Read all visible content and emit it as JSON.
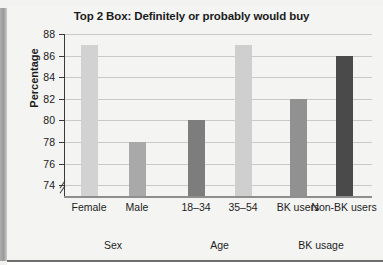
{
  "figure": {
    "background_color": "#f4f4f2",
    "panel_border_color": "#6e6e6e"
  },
  "chart_data": {
    "type": "bar",
    "title": "Top 2 Box: Definitely or probably would buy",
    "xlabel": "",
    "ylabel": "Percentage",
    "ylim": [
      73,
      88
    ],
    "yticks": [
      74,
      76,
      78,
      80,
      82,
      84,
      86,
      88
    ],
    "grid": true,
    "legend": "none",
    "axis_break": true,
    "categories": [
      "Female",
      "Male",
      "18–34",
      "35–54",
      "BK users",
      "Non-BK users"
    ],
    "values": [
      87,
      78,
      80,
      87,
      82,
      86
    ],
    "bar_colors": [
      "#d2d2d2",
      "#a9a9a9",
      "#7d7d7d",
      "#cfcfcf",
      "#919191",
      "#4a4a4a"
    ],
    "groups": [
      {
        "label": "Sex",
        "categories": [
          "Female",
          "Male"
        ]
      },
      {
        "label": "Age",
        "categories": [
          "18–34",
          "35–54"
        ]
      },
      {
        "label": "BK usage",
        "categories": [
          "BK users",
          "Non-BK users"
        ]
      }
    ]
  }
}
